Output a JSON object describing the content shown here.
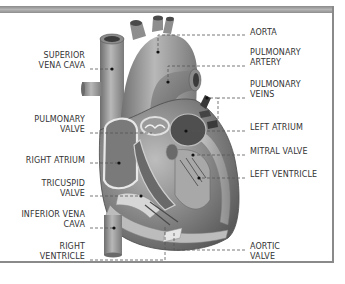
{
  "diagram": {
    "left_labels": [
      {
        "line1": "SUPERIOR",
        "line2": "VENA CAVA"
      },
      {
        "line1": "PULMONARY",
        "line2": "VALVE"
      },
      {
        "line1": "RIGHT ATRIUM",
        "line2": ""
      },
      {
        "line1": "TRICUSPID",
        "line2": "VALVE"
      },
      {
        "line1": "INFERIOR VENA",
        "line2": "CAVA"
      },
      {
        "line1": "RIGHT",
        "line2": "VENTRICLE"
      }
    ],
    "right_labels": [
      {
        "line1": "AORTA",
        "line2": ""
      },
      {
        "line1": "PULMONARY",
        "line2": "ARTERY"
      },
      {
        "line1": "PULMONARY",
        "line2": "VEINS"
      },
      {
        "line1": "LEFT ATRIUM",
        "line2": ""
      },
      {
        "line1": "MITRAL VALVE",
        "line2": ""
      },
      {
        "line1": "LEFT VENTRICLE",
        "line2": ""
      },
      {
        "line1": "AORTIC",
        "line2": "VALVE"
      }
    ]
  }
}
